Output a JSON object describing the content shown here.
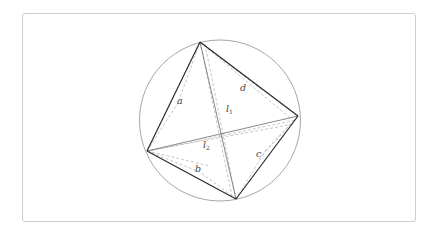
{
  "diagram": {
    "type": "cyclic-quadrilateral",
    "circle": {
      "cx": 220,
      "cy": 120,
      "r": 80,
      "stroke": "#8a8a8a"
    },
    "vertices": {
      "top": [
        200,
        42
      ],
      "right": [
        298,
        116
      ],
      "bottom": [
        236,
        199
      ],
      "left": [
        147,
        151
      ]
    },
    "sides": [
      {
        "id": "a",
        "label": "a",
        "from": "top",
        "to": "left"
      },
      {
        "id": "b",
        "label": "b",
        "from": "left",
        "to": "bottom"
      },
      {
        "id": "c",
        "label": "c",
        "from": "bottom",
        "to": "right"
      },
      {
        "id": "d",
        "label": "d",
        "from": "top",
        "to": "right"
      }
    ],
    "diagonals": [
      {
        "id": "l1",
        "label": "l",
        "subscript": "1",
        "from": "top",
        "to": "bottom"
      },
      {
        "id": "l2",
        "label": "l",
        "subscript": "2",
        "from": "left",
        "to": "right"
      }
    ],
    "colors": {
      "side": "#2b2b2b",
      "diagonal": "#666666",
      "dashed": "#b5b5b5",
      "frame": "#cfcfcf"
    },
    "labels": {
      "a": "a",
      "b": "b",
      "c": "c",
      "d": "d",
      "l1_main": "l",
      "l1_sub": "1",
      "l2_main": "l",
      "l2_sub": "2"
    }
  }
}
